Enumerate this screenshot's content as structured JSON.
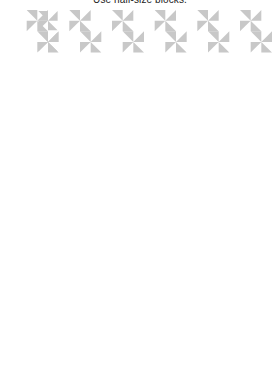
{
  "caption": "Use half-size blocks.",
  "colors": {
    "line": "#1a1a1a",
    "shade": "#c8c8c8",
    "bg": "#ffffff",
    "dot": "#000000"
  },
  "quilt": {
    "x": 16,
    "y": 10,
    "width": 256,
    "height": 351,
    "small_cols": 24,
    "small_rows": 33,
    "border_cells": 4,
    "center": {
      "cols": 8,
      "rows": 12
    }
  }
}
